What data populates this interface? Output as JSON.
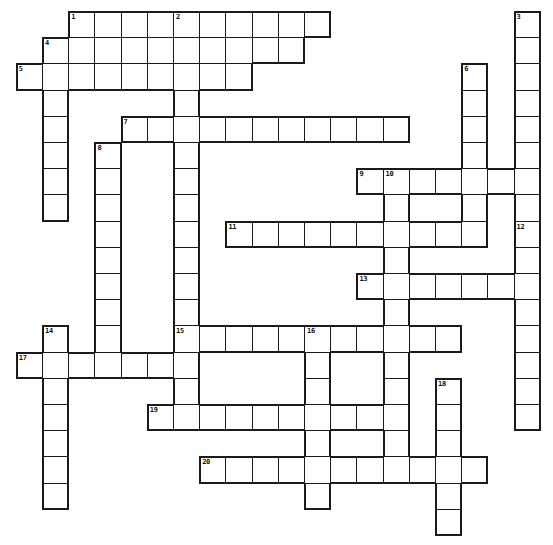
{
  "puzzle": {
    "title": "Crossword Puzzle Grid",
    "width_px": 553,
    "height_px": 545,
    "cell_size_px": 26.2,
    "origin_x_px": 15.8,
    "origin_y_px": 11,
    "cell_fill_color": "#ffffff",
    "cell_border_color": "#1a1a1a",
    "background_color": "#ffffff",
    "number_color": "#111111",
    "total_clues": 20,
    "across_count": 10,
    "down_count": 10
  },
  "entries": [
    {
      "number": "1",
      "direction": "across",
      "col": 2,
      "row": 0,
      "length": 10
    },
    {
      "number": "1",
      "direction": "down",
      "col": 2,
      "row": 0,
      "length": 1
    },
    {
      "number": "2",
      "direction": "down",
      "col": 6,
      "row": 0,
      "length": 14
    },
    {
      "number": "3",
      "direction": "down",
      "col": 19,
      "row": 0,
      "length": 13
    },
    {
      "number": "4",
      "direction": "across",
      "col": 1,
      "row": 1,
      "length": 10
    },
    {
      "number": "4",
      "direction": "down",
      "col": 1,
      "row": 1,
      "length": 7
    },
    {
      "number": "5",
      "direction": "across",
      "col": 0,
      "row": 2,
      "length": 9
    },
    {
      "number": "6",
      "direction": "down",
      "col": 17,
      "row": 2,
      "length": 8
    },
    {
      "number": "7",
      "direction": "across",
      "col": 4,
      "row": 4,
      "length": 11
    },
    {
      "number": "8",
      "direction": "down",
      "col": 3,
      "row": 5,
      "length": 8
    },
    {
      "number": "9",
      "direction": "across",
      "col": 13,
      "row": 6,
      "length": 7
    },
    {
      "number": "10",
      "direction": "down",
      "col": 14,
      "row": 6,
      "length": 13
    },
    {
      "number": "11",
      "direction": "across",
      "col": 8,
      "row": 8,
      "length": 10
    },
    {
      "number": "12",
      "direction": "down",
      "col": 19,
      "row": 8,
      "length": 8
    },
    {
      "number": "13",
      "direction": "across",
      "col": 13,
      "row": 10,
      "length": 6
    },
    {
      "number": "14",
      "direction": "down",
      "col": 1,
      "row": 12,
      "length": 7
    },
    {
      "number": "15",
      "direction": "across",
      "col": 6,
      "row": 12,
      "length": 11
    },
    {
      "number": "16",
      "direction": "down",
      "col": 11,
      "row": 12,
      "length": 7
    },
    {
      "number": "17",
      "direction": "across",
      "col": 0,
      "row": 13,
      "length": 7
    },
    {
      "number": "18",
      "direction": "down",
      "col": 16,
      "row": 14,
      "length": 6
    },
    {
      "number": "19",
      "direction": "across",
      "col": 5,
      "row": 15,
      "length": 9
    },
    {
      "number": "20",
      "direction": "across",
      "col": 7,
      "row": 17,
      "length": 11
    }
  ],
  "cells": [
    {
      "col": 2,
      "row": 0,
      "num": "1"
    },
    {
      "col": 3,
      "row": 0
    },
    {
      "col": 4,
      "row": 0
    },
    {
      "col": 5,
      "row": 0
    },
    {
      "col": 6,
      "row": 0,
      "num": "2"
    },
    {
      "col": 7,
      "row": 0
    },
    {
      "col": 8,
      "row": 0
    },
    {
      "col": 9,
      "row": 0
    },
    {
      "col": 10,
      "row": 0
    },
    {
      "col": 11,
      "row": 0
    },
    {
      "col": 19,
      "row": 0,
      "num": "3"
    },
    {
      "col": 1,
      "row": 1,
      "num": "4"
    },
    {
      "col": 2,
      "row": 1
    },
    {
      "col": 3,
      "row": 1
    },
    {
      "col": 4,
      "row": 1
    },
    {
      "col": 5,
      "row": 1
    },
    {
      "col": 6,
      "row": 1
    },
    {
      "col": 7,
      "row": 1
    },
    {
      "col": 8,
      "row": 1
    },
    {
      "col": 9,
      "row": 1
    },
    {
      "col": 10,
      "row": 1
    },
    {
      "col": 19,
      "row": 1
    },
    {
      "col": 0,
      "row": 2,
      "num": "5"
    },
    {
      "col": 1,
      "row": 2
    },
    {
      "col": 2,
      "row": 2
    },
    {
      "col": 3,
      "row": 2
    },
    {
      "col": 4,
      "row": 2
    },
    {
      "col": 5,
      "row": 2
    },
    {
      "col": 6,
      "row": 2
    },
    {
      "col": 7,
      "row": 2
    },
    {
      "col": 8,
      "row": 2
    },
    {
      "col": 17,
      "row": 2,
      "num": "6"
    },
    {
      "col": 19,
      "row": 2
    },
    {
      "col": 1,
      "row": 3
    },
    {
      "col": 6,
      "row": 3
    },
    {
      "col": 17,
      "row": 3
    },
    {
      "col": 19,
      "row": 3
    },
    {
      "col": 1,
      "row": 4
    },
    {
      "col": 4,
      "row": 4,
      "num": "7"
    },
    {
      "col": 5,
      "row": 4
    },
    {
      "col": 6,
      "row": 4
    },
    {
      "col": 7,
      "row": 4
    },
    {
      "col": 8,
      "row": 4
    },
    {
      "col": 9,
      "row": 4
    },
    {
      "col": 10,
      "row": 4
    },
    {
      "col": 11,
      "row": 4
    },
    {
      "col": 12,
      "row": 4
    },
    {
      "col": 13,
      "row": 4
    },
    {
      "col": 14,
      "row": 4
    },
    {
      "col": 17,
      "row": 4
    },
    {
      "col": 19,
      "row": 4
    },
    {
      "col": 1,
      "row": 5
    },
    {
      "col": 3,
      "row": 5,
      "num": "8"
    },
    {
      "col": 6,
      "row": 5
    },
    {
      "col": 17,
      "row": 5
    },
    {
      "col": 19,
      "row": 5
    },
    {
      "col": 1,
      "row": 6
    },
    {
      "col": 3,
      "row": 6
    },
    {
      "col": 6,
      "row": 6
    },
    {
      "col": 13,
      "row": 6,
      "num": "9"
    },
    {
      "col": 14,
      "row": 6,
      "num": "10"
    },
    {
      "col": 15,
      "row": 6
    },
    {
      "col": 16,
      "row": 6
    },
    {
      "col": 17,
      "row": 6
    },
    {
      "col": 18,
      "row": 6
    },
    {
      "col": 19,
      "row": 6
    },
    {
      "col": 1,
      "row": 7
    },
    {
      "col": 3,
      "row": 7
    },
    {
      "col": 6,
      "row": 7
    },
    {
      "col": 14,
      "row": 7
    },
    {
      "col": 17,
      "row": 7
    },
    {
      "col": 19,
      "row": 7
    },
    {
      "col": 8,
      "row": 8,
      "num": "11"
    },
    {
      "col": 9,
      "row": 8
    },
    {
      "col": 10,
      "row": 8
    },
    {
      "col": 11,
      "row": 8
    },
    {
      "col": 12,
      "row": 8
    },
    {
      "col": 13,
      "row": 8
    },
    {
      "col": 14,
      "row": 8
    },
    {
      "col": 15,
      "row": 8
    },
    {
      "col": 16,
      "row": 8
    },
    {
      "col": 17,
      "row": 8
    },
    {
      "col": 3,
      "row": 8
    },
    {
      "col": 6,
      "row": 8
    },
    {
      "col": 19,
      "row": 8,
      "num": "12"
    },
    {
      "col": 3,
      "row": 9
    },
    {
      "col": 6,
      "row": 9
    },
    {
      "col": 14,
      "row": 9
    },
    {
      "col": 19,
      "row": 9
    },
    {
      "col": 3,
      "row": 10
    },
    {
      "col": 6,
      "row": 10
    },
    {
      "col": 13,
      "row": 10,
      "num": "13"
    },
    {
      "col": 14,
      "row": 10
    },
    {
      "col": 15,
      "row": 10
    },
    {
      "col": 16,
      "row": 10
    },
    {
      "col": 17,
      "row": 10
    },
    {
      "col": 18,
      "row": 10
    },
    {
      "col": 19,
      "row": 10
    },
    {
      "col": 3,
      "row": 11
    },
    {
      "col": 6,
      "row": 11
    },
    {
      "col": 14,
      "row": 11
    },
    {
      "col": 19,
      "row": 11
    },
    {
      "col": 1,
      "row": 12,
      "num": "14"
    },
    {
      "col": 3,
      "row": 12
    },
    {
      "col": 6,
      "row": 12,
      "num": "15"
    },
    {
      "col": 7,
      "row": 12
    },
    {
      "col": 8,
      "row": 12
    },
    {
      "col": 9,
      "row": 12
    },
    {
      "col": 10,
      "row": 12
    },
    {
      "col": 11,
      "row": 12,
      "num": "16"
    },
    {
      "col": 12,
      "row": 12
    },
    {
      "col": 13,
      "row": 12
    },
    {
      "col": 14,
      "row": 12
    },
    {
      "col": 15,
      "row": 12
    },
    {
      "col": 16,
      "row": 12
    },
    {
      "col": 19,
      "row": 12
    },
    {
      "col": 0,
      "row": 13,
      "num": "17"
    },
    {
      "col": 1,
      "row": 13
    },
    {
      "col": 2,
      "row": 13
    },
    {
      "col": 3,
      "row": 13
    },
    {
      "col": 4,
      "row": 13
    },
    {
      "col": 5,
      "row": 13
    },
    {
      "col": 6,
      "row": 13
    },
    {
      "col": 11,
      "row": 13
    },
    {
      "col": 14,
      "row": 13
    },
    {
      "col": 19,
      "row": 13
    },
    {
      "col": 1,
      "row": 14
    },
    {
      "col": 6,
      "row": 14
    },
    {
      "col": 11,
      "row": 14
    },
    {
      "col": 14,
      "row": 14
    },
    {
      "col": 16,
      "row": 14,
      "num": "18"
    },
    {
      "col": 19,
      "row": 14
    },
    {
      "col": 1,
      "row": 15
    },
    {
      "col": 5,
      "row": 15,
      "num": "19"
    },
    {
      "col": 6,
      "row": 15
    },
    {
      "col": 7,
      "row": 15
    },
    {
      "col": 8,
      "row": 15
    },
    {
      "col": 9,
      "row": 15
    },
    {
      "col": 10,
      "row": 15
    },
    {
      "col": 11,
      "row": 15
    },
    {
      "col": 12,
      "row": 15
    },
    {
      "col": 13,
      "row": 15
    },
    {
      "col": 14,
      "row": 15
    },
    {
      "col": 16,
      "row": 15
    },
    {
      "col": 19,
      "row": 15
    },
    {
      "col": 1,
      "row": 16
    },
    {
      "col": 11,
      "row": 16
    },
    {
      "col": 14,
      "row": 16
    },
    {
      "col": 16,
      "row": 16
    },
    {
      "col": 1,
      "row": 17
    },
    {
      "col": 7,
      "row": 17,
      "num": "20"
    },
    {
      "col": 8,
      "row": 17
    },
    {
      "col": 9,
      "row": 17
    },
    {
      "col": 10,
      "row": 17
    },
    {
      "col": 11,
      "row": 17
    },
    {
      "col": 12,
      "row": 17
    },
    {
      "col": 13,
      "row": 17
    },
    {
      "col": 14,
      "row": 17
    },
    {
      "col": 15,
      "row": 17
    },
    {
      "col": 16,
      "row": 17
    },
    {
      "col": 17,
      "row": 17
    },
    {
      "col": 1,
      "row": 18
    },
    {
      "col": 11,
      "row": 18
    },
    {
      "col": 16,
      "row": 18
    },
    {
      "col": 16,
      "row": 19
    }
  ]
}
